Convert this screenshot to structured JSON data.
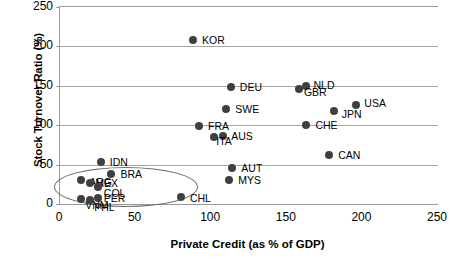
{
  "chart_data": {
    "type": "scatter",
    "title": "",
    "xlabel": "Private Credit (as % of GDP)",
    "ylabel": "Stock Turnover Ratio (%)",
    "xlim": [
      0,
      250
    ],
    "ylim": [
      0,
      250
    ],
    "xticks": [
      0,
      50,
      100,
      150,
      200,
      250
    ],
    "yticks": [
      0,
      50,
      100,
      150,
      200,
      250
    ],
    "xtick_labels": [
      "0",
      "50",
      "100",
      "150",
      "200",
      "250"
    ],
    "ytick_labels": [
      "0",
      "50",
      "100",
      "150",
      "200",
      "250"
    ],
    "grid": "horizontal",
    "legend": "none",
    "points": [
      {
        "label": "KOR",
        "x": 88,
        "y": 208,
        "lx": 9,
        "ly": -5
      },
      {
        "label": "DEU",
        "x": 113,
        "y": 148,
        "lx": 9,
        "ly": -5
      },
      {
        "label": "NLD",
        "x": 163,
        "y": 150,
        "lx": 7,
        "ly": -6
      },
      {
        "label": "GBR",
        "x": 158,
        "y": 146,
        "lx": 5,
        "ly": -2
      },
      {
        "label": "SWE",
        "x": 110,
        "y": 120,
        "lx": 9,
        "ly": -5
      },
      {
        "label": "USA",
        "x": 196,
        "y": 126,
        "lx": 8,
        "ly": -7
      },
      {
        "label": "JPN",
        "x": 181,
        "y": 118,
        "lx": 8,
        "ly": -2
      },
      {
        "label": "CHE",
        "x": 163,
        "y": 100,
        "lx": 9,
        "ly": -5
      },
      {
        "label": "FRA",
        "x": 92,
        "y": 99,
        "lx": 9,
        "ly": -5
      },
      {
        "label": "AUS",
        "x": 108,
        "y": 86,
        "lx": 8,
        "ly": -5
      },
      {
        "label": "ITA",
        "x": 102,
        "y": 85,
        "lx": 2,
        "ly": -1
      },
      {
        "label": "CAN",
        "x": 178,
        "y": 62,
        "lx": 9,
        "ly": -5
      },
      {
        "label": "AUT",
        "x": 114,
        "y": 46,
        "lx": 9,
        "ly": -5
      },
      {
        "label": "MYS",
        "x": 112,
        "y": 31,
        "lx": 9,
        "ly": -5
      },
      {
        "label": "IDN",
        "x": 27,
        "y": 53,
        "lx": 9,
        "ly": -5
      },
      {
        "label": "BRA",
        "x": 34,
        "y": 38,
        "lx": 9,
        "ly": -5
      },
      {
        "label": "ARG",
        "x": 14,
        "y": 30,
        "lx": 8,
        "ly": -3
      },
      {
        "label": "MEX",
        "x": 20,
        "y": 27,
        "lx": 5,
        "ly": 0
      },
      {
        "label": "COL",
        "x": 25,
        "y": 21,
        "lx": 6,
        "ly": 1
      },
      {
        "label": "PER",
        "x": 25,
        "y": 8,
        "lx": 6,
        "ly": 0
      },
      {
        "label": "VNM",
        "x": 14,
        "y": 6,
        "lx": 4,
        "ly": 1
      },
      {
        "label": "PHL",
        "x": 20,
        "y": 5,
        "lx": 4,
        "ly": 2
      },
      {
        "label": "CHL",
        "x": 80,
        "y": 9,
        "lx": 9,
        "ly": -4
      }
    ],
    "annotations": [
      {
        "name": "emerging-markets-ellipse",
        "shape": "ellipse",
        "cx": 43,
        "cy": 23,
        "rx": 47,
        "ry": 24
      }
    ],
    "colors": {
      "marker": "#3f3f3f",
      "grid": "#a6a6a6",
      "axis": "#9a9a9a",
      "text": "#000000",
      "ellipse": "#6f6f6f"
    }
  }
}
